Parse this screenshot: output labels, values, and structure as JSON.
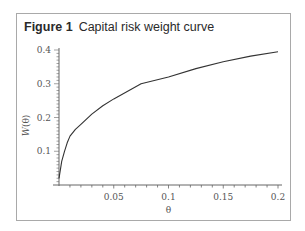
{
  "figure": {
    "number_label": "Figure 1",
    "caption": "Capital risk weight curve"
  },
  "chart_data": {
    "type": "line",
    "title": "Capital risk weight curve",
    "xlabel": "θ",
    "ylabel": "W(θ)",
    "xlim": [
      0,
      0.2
    ],
    "ylim": [
      0,
      0.4
    ],
    "xticks": [
      0.05,
      0.1,
      0.15,
      0.2
    ],
    "xtick_labels": [
      "0.05",
      "0.1",
      "0.15",
      "0.2"
    ],
    "yticks": [
      0.1,
      0.2,
      0.3,
      0.4
    ],
    "ytick_labels": [
      "0.1",
      "0.2",
      "0.3",
      "0.4"
    ],
    "grid": false,
    "legend": null,
    "series": [
      {
        "name": "W(θ)",
        "x": [
          0,
          0.0025,
          0.005,
          0.0075,
          0.01,
          0.015,
          0.02,
          0.03,
          0.04,
          0.05,
          0.075,
          0.1,
          0.125,
          0.15,
          0.175,
          0.2
        ],
        "values": [
          0.02,
          0.07,
          0.1,
          0.125,
          0.145,
          0.165,
          0.18,
          0.21,
          0.235,
          0.255,
          0.3,
          0.32,
          0.345,
          0.365,
          0.382,
          0.395
        ]
      }
    ]
  }
}
